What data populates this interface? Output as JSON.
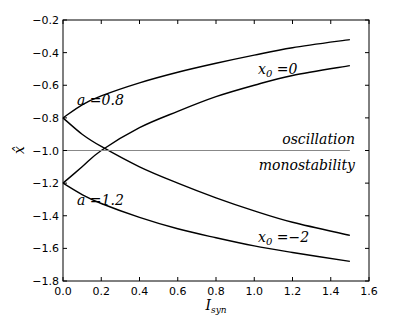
{
  "chart_data": {
    "type": "line",
    "title": "",
    "xlabel": "I_syn",
    "ylabel": "x̂",
    "xlim": [
      0.0,
      1.6
    ],
    "ylim": [
      -1.8,
      -0.2
    ],
    "grid": false,
    "xticks": [
      "0.0",
      "0.2",
      "0.4",
      "0.6",
      "0.8",
      "1.0",
      "1.2",
      "1.4",
      "1.6"
    ],
    "yticks": [
      "−0.2",
      "−0.4",
      "−0.6",
      "−0.8",
      "−1.0",
      "−1.2",
      "−1.4",
      "−1.6",
      "−1.8"
    ],
    "series": [
      {
        "name": "a=0.8 upper (x0=0)",
        "x": [
          0,
          0.1,
          0.2,
          0.4,
          0.6,
          0.8,
          1.0,
          1.2,
          1.5
        ],
        "y": [
          -0.8,
          -0.72,
          -0.665,
          -0.585,
          -0.52,
          -0.465,
          -0.415,
          -0.37,
          -0.32
        ]
      },
      {
        "name": "a=0.8 lower (x0=-2)",
        "x": [
          0,
          0.1,
          0.2,
          0.4,
          0.6,
          0.8,
          1.0,
          1.2,
          1.5
        ],
        "y": [
          -0.8,
          -0.9,
          -0.975,
          -1.1,
          -1.2,
          -1.29,
          -1.37,
          -1.44,
          -1.52
        ]
      },
      {
        "name": "a=1.2 upper (x0=0)",
        "x": [
          0,
          0.1,
          0.2,
          0.4,
          0.6,
          0.8,
          1.0,
          1.2,
          1.5
        ],
        "y": [
          -1.2,
          -1.1,
          -1.0,
          -0.86,
          -0.76,
          -0.67,
          -0.6,
          -0.54,
          -0.48
        ]
      },
      {
        "name": "a=1.2 lower (x0=-2)",
        "x": [
          0,
          0.1,
          0.2,
          0.4,
          0.6,
          0.8,
          1.0,
          1.2,
          1.5
        ],
        "y": [
          -1.2,
          -1.27,
          -1.325,
          -1.41,
          -1.48,
          -1.535,
          -1.585,
          -1.625,
          -1.68
        ]
      },
      {
        "name": "boundary",
        "x": [
          0,
          1.5
        ],
        "y": [
          -1.0,
          -1.0
        ]
      }
    ],
    "annotations": [
      {
        "text": "a =0.8",
        "x": 0.07,
        "y": -0.8
      },
      {
        "text": "a =1.2",
        "x": 0.07,
        "y": -1.2
      },
      {
        "text": "x0 =0",
        "x": 1.0,
        "y": -0.53
      },
      {
        "text": "x0 =−2",
        "x": 1.0,
        "y": -1.57
      },
      {
        "text": "oscillation",
        "x": 1.18,
        "y": -0.96
      },
      {
        "text": "monostability",
        "x": 1.12,
        "y": -1.06
      }
    ]
  },
  "labels": {
    "a08": "a =0.8",
    "a12": "a =1.2",
    "x0_0": "x",
    "x0_0_sub": "0",
    "x0_0_val": " =0",
    "x0_m2_val": " =−2",
    "osc": "oscillation",
    "mono": "monostability",
    "xlabel_main": "I",
    "xlabel_sub": "syn",
    "ylabel": "x̂"
  }
}
